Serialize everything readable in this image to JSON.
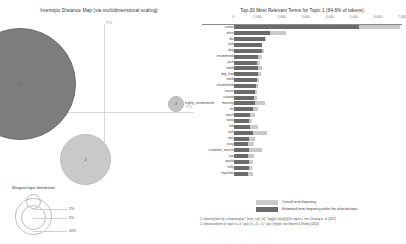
{
  "left_panel": {
    "title": "Intertopic Distance Map (via multidimensional scaling)",
    "axis_labels": {
      "x": "PC1",
      "y": "PC2"
    },
    "topics": [
      {
        "id": "1",
        "label": "1"
      },
      {
        "id": "2",
        "label": "2"
      },
      {
        "id": "3",
        "label": "3",
        "side_label": "highly_recommend"
      }
    ],
    "marginal_legend": {
      "title": "Marginal topic distribution",
      "ticks": [
        "2%",
        "5%",
        "10%"
      ]
    }
  },
  "right_panel": {
    "title": "Top-30 Most Relevant Terms for Topic 1 (84.6% of tokens)",
    "legend": {
      "overall": "Overall term frequency",
      "topic": "Estimated term frequency within the selected topic"
    },
    "footnotes": [
      "1. saliency(term w) = frequency(w) * [sum_t p(t | w) * log(p(t | w)/p(t))] for topics t; see Chuang et. al (2012)",
      "2. relevance(term w | topic t) = λ * p(w | t) + (1 - λ) * p(w | t)/p(w); see Sievert & Shirley (2014)"
    ]
  },
  "chart_data": {
    "type": "bar",
    "title": "Top-30 Most Relevant Terms for Topic 1 (84.6% of tokens)",
    "xlabel": "",
    "ylabel": "",
    "xlim": [
      0,
      7000
    ],
    "xticks": [
      0,
      1000,
      2000,
      3000,
      4000,
      5000,
      6000,
      7000
    ],
    "grid": false,
    "orientation": "horizontal",
    "legend_position": "bottom",
    "categories": [
      "cream",
      "drive",
      "die",
      "had",
      "dog",
      "recommend",
      "pick",
      "lamb",
      "dog_had",
      "need",
      "recommend",
      "house",
      "caused",
      "morning",
      "for",
      "wash",
      "keep",
      "fed",
      "ball",
      "tree",
      "easy",
      "customer_service",
      "tap",
      "would",
      "help",
      "machine"
    ],
    "series": [
      {
        "name": "Overall term frequency",
        "values": [
          6900,
          2200,
          1350,
          1200,
          1250,
          1180,
          1100,
          1180,
          1130,
          1040,
          1000,
          980,
          960,
          1320,
          1000,
          880,
          760,
          1000,
          1400,
          900,
          860,
          1200,
          840,
          820,
          780,
          800
        ]
      },
      {
        "name": "Estimated term frequency within the selected topic",
        "values": [
          5200,
          1500,
          1300,
          1180,
          1180,
          1000,
          990,
          1010,
          1020,
          980,
          930,
          880,
          850,
          900,
          830,
          700,
          640,
          680,
          800,
          640,
          620,
          640,
          600,
          660,
          660,
          620
        ]
      }
    ]
  }
}
